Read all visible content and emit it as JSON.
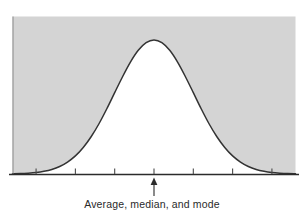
{
  "figure": {
    "caption": "Average, median, and mode",
    "annotation_icon": "up-arrow-icon",
    "colors": {
      "plot_background": "#d4d4d4",
      "curve_fill": "#ffffff",
      "curve_stroke": "#333333",
      "axis": "#2b2b2b",
      "page_background": "#ffffff",
      "caption_text": "#2a2a2a"
    }
  },
  "chart_data": {
    "type": "line",
    "title": "",
    "subtitle": "",
    "xlabel": "",
    "ylabel": "",
    "grid": false,
    "legend": "none",
    "distribution": "normal",
    "annotations": [
      {
        "text": "Average, median, and mode",
        "x": 0,
        "pointer": "up-arrow-icon",
        "target": "peak"
      }
    ],
    "axis": {
      "x_range": [
        -3.6,
        3.6
      ],
      "y_range": [
        0,
        1.12
      ],
      "x_tick_positions": [
        -3.0,
        -2.0,
        -1.0,
        0.0,
        1.0,
        2.0,
        3.0
      ],
      "x_tick_labels": [
        "",
        "",
        "",
        "",
        "",
        "",
        ""
      ],
      "y_ticks": []
    },
    "series": [
      {
        "name": "Normal distribution",
        "mean": 0,
        "std_dev": 1,
        "peak_value": 1.0,
        "x": [
          -3.6,
          -3.4,
          -3.2,
          -3.0,
          -2.8,
          -2.6,
          -2.4,
          -2.2,
          -2.0,
          -1.8,
          -1.6,
          -1.4,
          -1.2,
          -1.0,
          -0.8,
          -0.6,
          -0.4,
          -0.2,
          0.0,
          0.2,
          0.4,
          0.6,
          0.8,
          1.0,
          1.2,
          1.4,
          1.6,
          1.8,
          2.0,
          2.2,
          2.4,
          2.6,
          2.8,
          3.0,
          3.2,
          3.4,
          3.6
        ],
        "values": [
          0.002,
          0.003,
          0.006,
          0.011,
          0.02,
          0.034,
          0.056,
          0.089,
          0.135,
          0.198,
          0.278,
          0.375,
          0.487,
          0.607,
          0.726,
          0.835,
          0.923,
          0.98,
          1.0,
          0.98,
          0.923,
          0.835,
          0.726,
          0.607,
          0.487,
          0.375,
          0.278,
          0.198,
          0.135,
          0.089,
          0.056,
          0.034,
          0.02,
          0.011,
          0.006,
          0.003,
          0.002
        ]
      }
    ]
  }
}
